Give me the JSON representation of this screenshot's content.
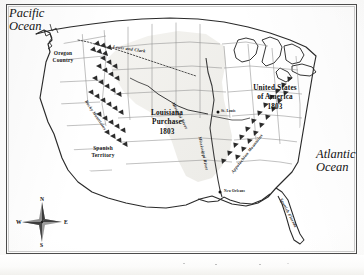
{
  "map": {
    "title_regions": {
      "pacific_ocean": "Pacific\nOcean",
      "pacific_line1": "Pacific",
      "pacific_line2": "Ocean",
      "atlantic_line1": "Atlantic",
      "atlantic_line2": "Ocean"
    },
    "territories": [
      {
        "name": "oregon-country",
        "line1": "Oregon",
        "line2": "Country"
      },
      {
        "name": "spanish-territory",
        "line1": "Spanish",
        "line2": "Territory"
      },
      {
        "name": "louisiana-purchase",
        "line1": "Louisiana",
        "line2": "Purchase",
        "line3": "1803"
      },
      {
        "name": "united-states",
        "line1": "United States",
        "line2": "of America",
        "line3": "1803"
      },
      {
        "name": "spanish-florida",
        "label": "Spanish Florida"
      }
    ],
    "cities": [
      {
        "name": "st-louis",
        "label": "St. Louis"
      },
      {
        "name": "new-orleans",
        "label": "New Orleans"
      }
    ],
    "physical_features": [
      {
        "name": "rocky-mountains",
        "label": "Rocky Mountains"
      },
      {
        "name": "appalachian-mountains",
        "label": "Appalachian Mountains"
      },
      {
        "name": "missouri-river",
        "label": "Missouri River"
      },
      {
        "name": "mississippi-river",
        "label": "Mississippi River"
      }
    ],
    "routes": [
      {
        "name": "lewis-and-clark",
        "label": "Lewis and Clark"
      }
    ],
    "compass": {
      "north": "N",
      "east": "E",
      "south": "S",
      "west": "W"
    },
    "colors": {
      "ink": "#1b1b1b",
      "coastline": "#2a2a2a",
      "state_border": "#8d8d8d",
      "purchase_fill": "#f0efeb",
      "paper": "#fdfdfc"
    }
  }
}
